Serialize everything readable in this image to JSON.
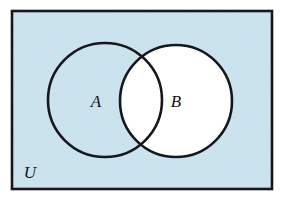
{
  "figure": {
    "type": "venn-diagram",
    "width": 283,
    "height": 203
  },
  "colors": {
    "universe_fill": "#cbe4ef",
    "circle_fill": "#ffffff",
    "stroke": "#16161c",
    "label_color": "#13131a",
    "page_background": "#ffffff"
  },
  "universe": {
    "label": "U",
    "label_x": 30,
    "label_y": 178,
    "rect": {
      "x": 12,
      "y": 11,
      "width": 260,
      "height": 178
    },
    "stroke_width": 2.6,
    "shaded": true
  },
  "sets": [
    {
      "name": "A",
      "label": "A",
      "label_x": 96,
      "label_y": 107,
      "cx": 105,
      "cy": 100,
      "r": 57,
      "filled_white": false,
      "stroke_width": 2.6
    },
    {
      "name": "B",
      "label": "B",
      "label_x": 176,
      "label_y": 107,
      "cx": 176,
      "cy": 101,
      "r": 56,
      "filled_white": true,
      "stroke_width": 2.6
    }
  ],
  "regions": {
    "a_only": "shaded",
    "intersection": "white",
    "b_only": "white",
    "outside_both": "shaded"
  },
  "label_font_size": 17
}
